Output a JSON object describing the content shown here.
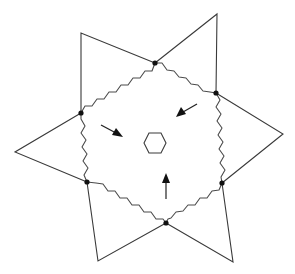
{
  "diagram": {
    "colors": {
      "stroke": "#3a3a3a",
      "node": "#111111",
      "background": "#ffffff"
    },
    "ring_nodes": [
      {
        "id": "top",
        "x": 155,
        "y": 63
      },
      {
        "id": "upper-right",
        "x": 216,
        "y": 93
      },
      {
        "id": "lower-right",
        "x": 222,
        "y": 183
      },
      {
        "id": "bottom",
        "x": 166,
        "y": 223
      },
      {
        "id": "lower-left",
        "x": 87,
        "y": 182
      },
      {
        "id": "upper-left",
        "x": 81,
        "y": 113
      }
    ],
    "outer_tips": [
      {
        "id": "top-left-tip",
        "x": 81,
        "y": 33
      },
      {
        "id": "top-right-tip",
        "x": 217,
        "y": 14
      },
      {
        "id": "right-tip",
        "x": 283,
        "y": 134
      },
      {
        "id": "bottom-right-tip",
        "x": 233,
        "y": 262
      },
      {
        "id": "bottom-left-tip",
        "x": 98,
        "y": 261
      },
      {
        "id": "left-tip",
        "x": 15,
        "y": 152
      }
    ],
    "center_hexagon": {
      "cx": 155,
      "cy": 143
    },
    "arrows": [
      {
        "id": "arrow-left",
        "from": [
          101,
          125
        ],
        "to": [
          123,
          137
        ]
      },
      {
        "id": "arrow-right",
        "from": [
          197,
          104
        ],
        "to": [
          176,
          117
        ]
      },
      {
        "id": "arrow-bottom",
        "from": [
          166,
          199
        ],
        "to": [
          166,
          173
        ]
      }
    ]
  }
}
